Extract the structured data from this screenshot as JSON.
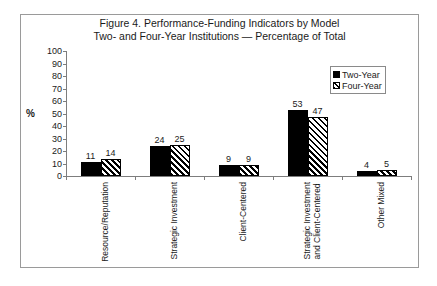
{
  "chart_data": {
    "type": "bar",
    "title": "Figure 4. Performance-Funding Indicators by Model",
    "subtitle": "Two- and Four-Year Institutions — Percentage of Total",
    "xlabel": "",
    "ylabel": "%",
    "ylim": [
      0,
      100
    ],
    "yticks": [
      0,
      10,
      20,
      30,
      40,
      50,
      60,
      70,
      80,
      90,
      100
    ],
    "grid": false,
    "legend_position": "top-right",
    "categories": [
      "Resource/Reputation",
      "Strategic Investment",
      "Client-Centered",
      "Strategic Investment and Client-Centered",
      "Other Mixed"
    ],
    "category_lines": [
      [
        "Resource/Reputation"
      ],
      [
        "Strategic Investment"
      ],
      [
        "Client-Centered"
      ],
      [
        "Strategic Investment",
        "and Client-Centered"
      ],
      [
        "Other Mixed"
      ]
    ],
    "series": [
      {
        "name": "Two-Year",
        "color": "#000000",
        "fill": "solid",
        "values": [
          11,
          24,
          9,
          53,
          4
        ]
      },
      {
        "name": "Four-Year",
        "color": "#000000",
        "fill": "diagonal-hatch",
        "values": [
          14,
          25,
          9,
          47,
          5
        ]
      }
    ]
  },
  "legend": {
    "items": [
      {
        "label": "Two-Year"
      },
      {
        "label": "Four-Year"
      }
    ]
  }
}
